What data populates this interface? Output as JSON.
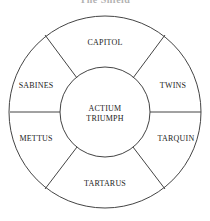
{
  "title": "The Shield",
  "diagram": {
    "type": "shield-wheel",
    "center_label": [
      "ACTIUM",
      "TRIUMPH"
    ],
    "segments": [
      {
        "position": "top",
        "label": "CAPITOL"
      },
      {
        "position": "upper-right",
        "label": "TWINS"
      },
      {
        "position": "lower-right",
        "label": "TARQUIN"
      },
      {
        "position": "bottom",
        "label": "TARTARUS"
      },
      {
        "position": "lower-left",
        "label": "METTUS"
      },
      {
        "position": "upper-left",
        "label": "SABINES"
      }
    ],
    "stroke_color": "#444444"
  }
}
